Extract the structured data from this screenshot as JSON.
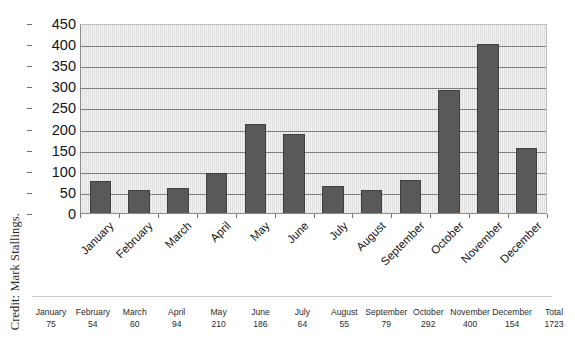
{
  "credit": {
    "text": "Credit: Mark Stallings."
  },
  "chart_data": {
    "type": "bar",
    "title": "",
    "subtitle": "",
    "xlabel": "",
    "ylabel": "",
    "categories": [
      "January",
      "February",
      "March",
      "April",
      "May",
      "June",
      "July",
      "August",
      "September",
      "October",
      "November",
      "December"
    ],
    "values": [
      75,
      54,
      60,
      94,
      210,
      186,
      64,
      55,
      79,
      292,
      400,
      154
    ],
    "ylim": [
      0,
      450
    ],
    "yticks": [
      0,
      50,
      100,
      150,
      200,
      250,
      300,
      350,
      400,
      450
    ],
    "ytick_labels": [
      "0",
      "50",
      "100",
      "150",
      "200",
      "250",
      "300",
      "350",
      "400",
      "450"
    ],
    "grid": "horizontal",
    "legend": "none",
    "bar_color": "#595959",
    "bar_edge_color": "#3f3f3f",
    "plot_background": "#e2e2e2",
    "gridline_color": "#7d7d7d",
    "axis_color": "#8a8a8a"
  },
  "data_table": {
    "headers": [
      "January",
      "February",
      "March",
      "April",
      "May",
      "June",
      "July",
      "August",
      "September",
      "October",
      "November",
      "December",
      "Total"
    ],
    "values": [
      "75",
      "54",
      "60",
      "94",
      "210",
      "186",
      "64",
      "55",
      "79",
      "292",
      "400",
      "154",
      "1723"
    ]
  }
}
